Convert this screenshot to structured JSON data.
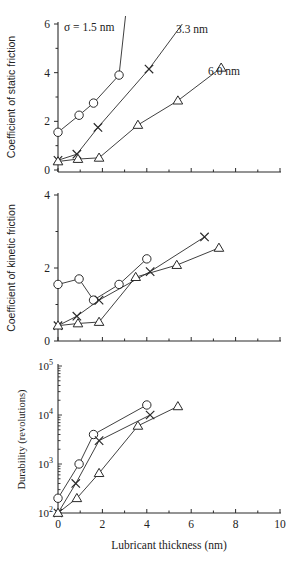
{
  "figure": {
    "width": 298,
    "height": 567,
    "ink_color": "#2a2a2a",
    "shared_xaxis": {
      "label": "Lubricant thickness (nm)",
      "range": [
        0,
        10
      ],
      "ticks": [
        0,
        2,
        4,
        6,
        8,
        10
      ],
      "minor_step": 1
    }
  },
  "chart_data": [
    {
      "type": "line",
      "title": "",
      "xlabel": "",
      "ylabel": "Coefficient of static friction",
      "xlim": [
        0,
        10
      ],
      "ylim": [
        0,
        6
      ],
      "yticks": [
        0,
        2,
        4,
        6
      ],
      "grid": false,
      "annotations": [
        {
          "text": "σ = 1.5 nm",
          "series": "σ = 1.5 nm"
        },
        {
          "text": "3.3 nm",
          "series": "σ = 3.3 nm"
        },
        {
          "text": "6.0 nm",
          "series": "σ = 6.0 nm"
        }
      ],
      "series": [
        {
          "name": "σ = 1.5 nm",
          "marker": "circle",
          "x": [
            0,
            0.95,
            1.6,
            2.75
          ],
          "y": [
            1.55,
            2.25,
            2.75,
            3.9
          ],
          "extension_to": [
            3.05,
            6.4
          ]
        },
        {
          "name": "σ = 3.3 nm",
          "marker": "cross",
          "x": [
            0,
            0.85,
            1.8,
            4.1
          ],
          "y": [
            0.4,
            0.65,
            1.75,
            4.15
          ],
          "extension_to": [
            5.6,
            6.0
          ]
        },
        {
          "name": "σ = 6.0 nm",
          "marker": "triangle",
          "x": [
            0,
            0.9,
            1.85,
            3.6,
            5.4,
            7.35
          ],
          "y": [
            0.35,
            0.45,
            0.5,
            1.85,
            2.85,
            4.2
          ]
        }
      ]
    },
    {
      "type": "line",
      "title": "",
      "xlabel": "",
      "ylabel": "Coefficient of kinetic friction",
      "xlim": [
        0,
        10
      ],
      "ylim": [
        0,
        4
      ],
      "yticks": [
        0,
        2,
        4
      ],
      "grid": false,
      "series": [
        {
          "name": "σ = 1.5 nm",
          "marker": "circle",
          "x": [
            0,
            0.95,
            1.6,
            2.75,
            4.0
          ],
          "y": [
            1.55,
            1.7,
            1.12,
            1.55,
            2.25
          ]
        },
        {
          "name": "σ = 3.3 nm",
          "marker": "cross",
          "x": [
            0,
            0.85,
            1.85,
            4.15,
            6.6
          ],
          "y": [
            0.42,
            0.68,
            1.12,
            1.9,
            2.85
          ]
        },
        {
          "name": "σ = 6.0 nm",
          "marker": "triangle",
          "x": [
            0,
            0.9,
            1.85,
            3.5,
            5.35,
            7.25
          ],
          "y": [
            0.42,
            0.48,
            0.52,
            1.75,
            2.08,
            2.55
          ]
        }
      ]
    },
    {
      "type": "line",
      "title": "",
      "xlabel": "Lubricant thickness (nm)",
      "ylabel": "Durability (revolutions)",
      "xlim": [
        0,
        10
      ],
      "ylim": [
        100,
        100000
      ],
      "yscale": "log",
      "yticks": [
        100,
        1000,
        10000,
        100000
      ],
      "ytick_labels": [
        [
          "10",
          "2"
        ],
        [
          "10",
          "3"
        ],
        [
          "10",
          "4"
        ],
        [
          "10",
          "5"
        ]
      ],
      "xticks": [
        0,
        2,
        4,
        6,
        8,
        10
      ],
      "grid": false,
      "series": [
        {
          "name": "σ = 1.5 nm",
          "marker": "circle",
          "x": [
            0,
            0.95,
            1.6,
            4.0
          ],
          "y": [
            200,
            1000,
            4000,
            16000
          ]
        },
        {
          "name": "σ = 3.3 nm",
          "marker": "cross",
          "x": [
            0,
            0.8,
            1.85,
            4.15
          ],
          "y": [
            100,
            400,
            3000,
            10000
          ]
        },
        {
          "name": "σ = 6.0 nm",
          "marker": "triangle",
          "x": [
            0,
            0.85,
            1.85,
            3.6,
            5.4
          ],
          "y": [
            100,
            200,
            650,
            6000,
            15000
          ]
        }
      ]
    }
  ],
  "layout": {
    "x0_px": 58,
    "x10_px": 280,
    "panels": [
      {
        "top": 24,
        "bottom": 170,
        "axis_y": 172,
        "ylabel_x": 15,
        "ylabel_sans": true,
        "annot_px": [
          [
            64,
            31
          ],
          [
            176,
            33
          ],
          [
            208,
            75
          ]
        ]
      },
      {
        "top": 195,
        "bottom": 341,
        "axis_y": 341,
        "ylabel_x": 15,
        "ylabel_sans": true
      },
      {
        "top": 366,
        "bottom": 513,
        "axis_y": 513,
        "ylabel_x": 25,
        "ylabel_sans": false
      }
    ]
  }
}
